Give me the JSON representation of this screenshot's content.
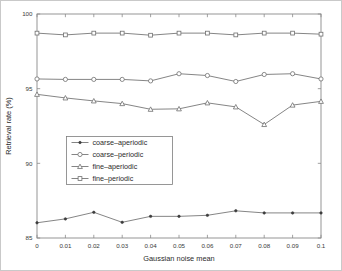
{
  "chart_data": {
    "type": "line",
    "title": "",
    "xlabel": "Gaussian noise mean",
    "ylabel": "Retrieval rate (%)",
    "x": [
      0,
      0.01,
      0.02,
      0.03,
      0.04,
      0.05,
      0.06,
      0.07,
      0.08,
      0.09,
      0.1
    ],
    "xtick_labels": [
      "0",
      "0.01",
      "0.02",
      "0.03",
      "0.04",
      "0.05",
      "0.06",
      "0.07",
      "0.08",
      "0.09",
      "0.1"
    ],
    "ytick_labels": [
      "85",
      "90",
      "95",
      "100"
    ],
    "yticks": [
      85,
      90,
      95,
      100
    ],
    "xlim": [
      0,
      0.1
    ],
    "ylim": [
      85,
      100
    ],
    "grid": false,
    "legend_position": "center-left",
    "series": [
      {
        "name": "coarse-aperiodic",
        "marker": "dot",
        "values": [
          86.02,
          86.28,
          86.72,
          86.05,
          86.45,
          86.45,
          86.52,
          86.82,
          86.68,
          86.68,
          86.68
        ]
      },
      {
        "name": "coarse-periodic",
        "marker": "circle",
        "values": [
          95.65,
          95.62,
          95.62,
          95.62,
          95.52,
          96.0,
          95.88,
          95.48,
          95.95,
          96.0,
          95.65
        ]
      },
      {
        "name": "fine-aperiodic",
        "marker": "triangle",
        "values": [
          94.62,
          94.38,
          94.18,
          94.0,
          93.62,
          93.65,
          94.05,
          93.78,
          92.6,
          93.9,
          94.15
        ]
      },
      {
        "name": "fine-periodic",
        "marker": "square",
        "values": [
          98.72,
          98.6,
          98.72,
          98.72,
          98.58,
          98.72,
          98.72,
          98.6,
          98.72,
          98.72,
          98.65
        ]
      }
    ]
  },
  "legend": {
    "items": [
      {
        "label": "coarse-aperiodic"
      },
      {
        "label": "coarse-periodic"
      },
      {
        "label": "fine-aperiodic"
      },
      {
        "label": "fine-periodic"
      }
    ]
  },
  "colors": {
    "line": "#6f6f6f",
    "marker_fill": "#3d3d3d",
    "axis": "#8a8a8a",
    "background": "#ffffff",
    "frame": "#c9c9c9"
  }
}
